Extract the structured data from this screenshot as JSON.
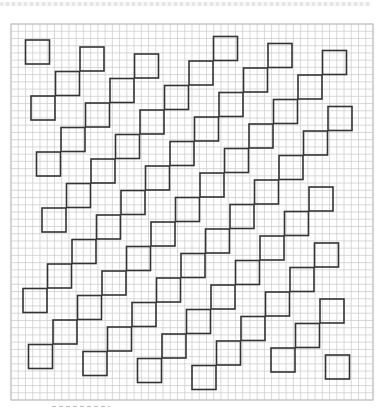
{
  "document": {
    "type": "graph-paper-pattern",
    "description": "Diagonal chains of squares drawn over square-ruled grid paper",
    "grid_columns": 50,
    "grid_rows": 52,
    "motif": "square",
    "motif_size_cells": 3.3,
    "chain_direction": "up-right to down-left",
    "colors": {
      "grid_line": "#c9c9c9",
      "motif_line": "#333333",
      "paper": "#ffffff",
      "border_pattern": "#e4e4e4"
    }
  }
}
